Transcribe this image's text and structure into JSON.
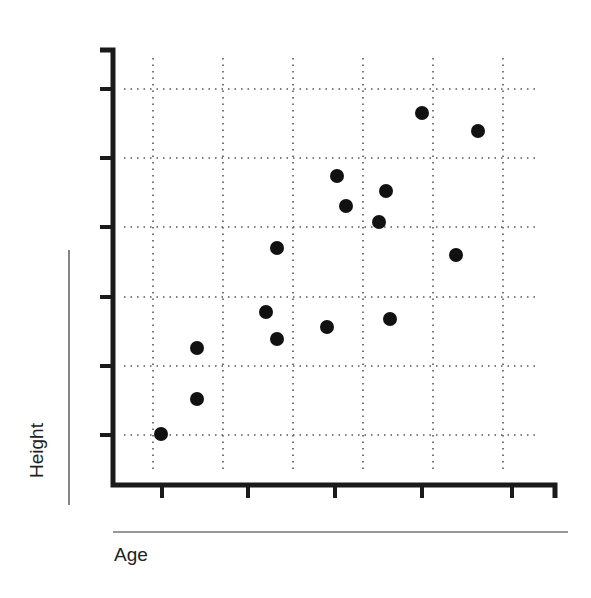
{
  "chart_data": {
    "type": "scatter",
    "title": "",
    "xlabel": "Age",
    "ylabel": "Height",
    "x_tick_labels": [],
    "y_tick_labels": [],
    "grid": true,
    "grid_style": "dotted",
    "legend": null,
    "xlim": [
      0,
      6
    ],
    "ylim": [
      0,
      6.5
    ],
    "points": [
      {
        "x": 0.1,
        "y": 0.0
      },
      {
        "x": 0.5,
        "y": 0.5
      },
      {
        "x": 0.5,
        "y": 1.25
      },
      {
        "x": 1.3,
        "y": 1.8
      },
      {
        "x": 1.45,
        "y": 1.4
      },
      {
        "x": 1.45,
        "y": 2.7
      },
      {
        "x": 2.0,
        "y": 1.6
      },
      {
        "x": 2.15,
        "y": 3.8
      },
      {
        "x": 2.25,
        "y": 3.35
      },
      {
        "x": 2.6,
        "y": 3.1
      },
      {
        "x": 2.7,
        "y": 3.55
      },
      {
        "x": 2.75,
        "y": 1.7
      },
      {
        "x": 3.1,
        "y": 4.7
      },
      {
        "x": 3.5,
        "y": 2.6
      },
      {
        "x": 3.75,
        "y": 4.4
      }
    ]
  },
  "layout": {
    "axis_color": "#1a1a1a",
    "grid_color": "#555555",
    "point_color": "#111111",
    "y_axis_x": 113,
    "y_axis_top": 50,
    "x_axis_y": 485,
    "x_axis_right": 555,
    "y_ticks_px": [
      89,
      158,
      227,
      297,
      366,
      435
    ],
    "x_ticks_px": [
      162,
      248,
      335,
      422,
      512,
      553
    ],
    "v_grid_px": [
      153,
      223,
      293,
      363,
      433,
      503
    ],
    "h_grid_px": [
      89,
      158,
      227,
      297,
      366,
      435
    ],
    "points_px": [
      [
        161,
        434
      ],
      [
        197,
        399
      ],
      [
        197,
        348
      ],
      [
        266,
        312
      ],
      [
        277,
        339
      ],
      [
        277,
        248
      ],
      [
        327,
        327
      ],
      [
        337,
        176
      ],
      [
        346,
        206
      ],
      [
        379,
        222
      ],
      [
        386,
        191
      ],
      [
        390,
        319
      ],
      [
        422,
        113
      ],
      [
        456,
        255
      ],
      [
        478,
        131
      ]
    ]
  }
}
